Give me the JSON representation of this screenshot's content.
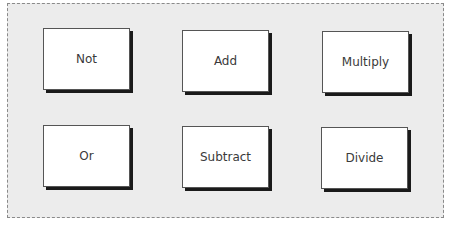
{
  "diagram": {
    "operations": [
      {
        "label": "Not"
      },
      {
        "label": "Add"
      },
      {
        "label": "Multiply"
      },
      {
        "label": "Or"
      },
      {
        "label": "Subtract"
      },
      {
        "label": "Divide"
      }
    ]
  },
  "colors": {
    "panel_background": "#ececec",
    "panel_border": "#8a8a8a",
    "box_background": "#ffffff",
    "box_shadow": "#1a1a1a",
    "text": "#3a3a3a"
  }
}
